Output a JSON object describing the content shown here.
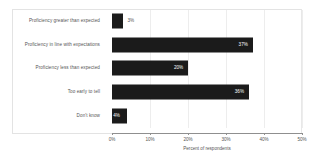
{
  "chart_data": {
    "type": "bar",
    "orientation": "horizontal",
    "title": "",
    "xlabel": "Percent of respondents",
    "ylabel": "",
    "xlim": [
      0,
      50
    ],
    "x_tick_labels": [
      "0%",
      "10%",
      "20%",
      "30%",
      "40%",
      "50%"
    ],
    "x_ticks": [
      0,
      10,
      20,
      30,
      40,
      50
    ],
    "grid": true,
    "legend": false,
    "bar_color": "#1b1b1b",
    "categories": [
      "Proficiency greater than expected",
      "Proficiency in line with expectations",
      "Proficiency less than expected",
      "Too early to tell",
      "Don't know"
    ],
    "values": [
      3,
      37,
      20,
      36,
      4
    ],
    "data_labels": [
      "3%",
      "37%",
      "20%",
      "36%",
      "4%"
    ],
    "label_placement": [
      "outside",
      "inside",
      "inside",
      "inside",
      "inside"
    ]
  }
}
